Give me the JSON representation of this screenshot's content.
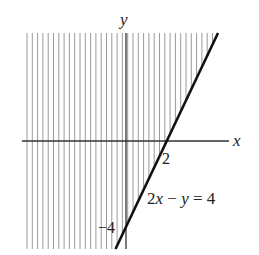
{
  "figure": {
    "type": "linear-inequality-graph",
    "axes": {
      "x_label": "x",
      "y_label": "y"
    },
    "boundary_line": {
      "equation_label": "2x − y = 4",
      "style": "solid",
      "x_intercept_label": "2",
      "y_intercept_label": "−4"
    },
    "shaded_region": {
      "description": "region left of / above the line (2x − y < 4)",
      "pattern": "vertical hatching"
    },
    "colors": {
      "line": "#111111",
      "axis": "#333333",
      "hatch": "#9a9a9a"
    }
  }
}
